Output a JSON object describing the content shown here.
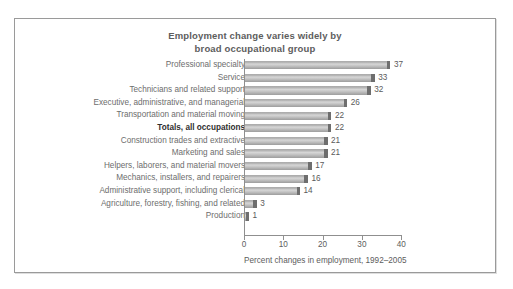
{
  "chart_data": {
    "type": "bar",
    "orientation": "horizontal",
    "title": "Employment change varies widely by broad occupational group",
    "title_lines": [
      "Employment change varies widely by",
      "broad occupational group"
    ],
    "xlabel": "Percent changes in employment, 1992–2005",
    "ylabel": "",
    "xlim": [
      0,
      40
    ],
    "xticks": [
      0,
      10,
      20,
      30,
      40
    ],
    "xtick_labels": [
      "0",
      "10",
      "20",
      "30",
      "40"
    ],
    "grid": false,
    "legend": null,
    "categories": [
      "Professional specialty",
      "Service",
      "Technicians and related support",
      "Executive, administrative, and managerial",
      "Transportation and material moving",
      "Totals, all occupations",
      "Construction trades and extractive",
      "Marketing and sales",
      "Helpers, laborers, and material movers",
      "Mechanics, installers, and repairers",
      "Administrative support, including clerical",
      "Agriculture, forestry, fishing, and related",
      "Production"
    ],
    "values": [
      37,
      33,
      32,
      26,
      22,
      22,
      21,
      21,
      17,
      16,
      14,
      3,
      1
    ],
    "value_labels": [
      "37",
      "33",
      "32",
      "26",
      "22",
      "22",
      "21",
      "21",
      "17",
      "16",
      "14",
      "3",
      "1"
    ],
    "highlighted_category": "Totals, all occupations",
    "colors": {
      "bar_fill": "#c6c6c6",
      "bar_cap": "#6e6e6e",
      "axis": "#8f8f8f",
      "text": "#5d5d5d",
      "highlight_text": "#2f2f2f",
      "frame_border": "#9a9a9a",
      "background": "#ffffff"
    }
  }
}
